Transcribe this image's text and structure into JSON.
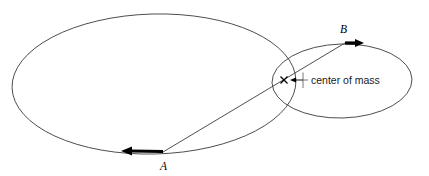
{
  "diagram": {
    "background_color": "#ffffff",
    "stroke_color": "#3b3b3b",
    "accent_color": "#000000",
    "labels": {
      "body_a": "A",
      "body_b": "B",
      "center_of_mass": "center of mass"
    },
    "orbits": [
      {
        "name": "large-orbit",
        "center_x": 154,
        "center_y": 84,
        "radius_x": 142,
        "radius_y": 70,
        "rotation_deg": -1.5
      },
      {
        "name": "small-orbit",
        "center_x": 342,
        "center_y": 81,
        "radius_x": 70,
        "radius_y": 37,
        "rotation_deg": -1.5
      }
    ],
    "points": {
      "a": {
        "x": 163,
        "y": 152
      },
      "b": {
        "x": 345,
        "y": 43
      },
      "center_of_mass": {
        "x": 284,
        "y": 80
      }
    },
    "velocity_arrows": [
      {
        "name": "velocity-arrow-a",
        "from_x": 163,
        "from_y": 152,
        "to_x": 126,
        "to_y": 151,
        "direction": "left"
      },
      {
        "name": "velocity-arrow-b",
        "from_x": 345,
        "from_y": 43,
        "to_x": 361,
        "to_y": 43,
        "direction": "right"
      }
    ],
    "leader": {
      "label_x": 311,
      "label_y": 84,
      "tick_x": 303,
      "tick_top_y": 73,
      "tick_bottom_y": 88,
      "line_from_x": 303,
      "line_from_y": 80,
      "line_to_x": 293,
      "line_to_y": 80,
      "arrow_tip_x": 290,
      "arrow_tip_y": 80
    }
  }
}
